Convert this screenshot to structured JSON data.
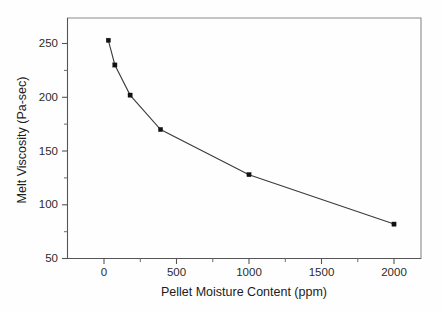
{
  "chart_data": {
    "type": "line",
    "title": "",
    "subtitle": "",
    "xlabel": "Pellet Moisture Content (ppm)",
    "ylabel": "Melt Viscosity (Pa-sec)",
    "xlim": [
      -200,
      2200
    ],
    "ylim": [
      50,
      268
    ],
    "grid": false,
    "legend": "none",
    "marker": "filled-square",
    "x_ticks": [
      0,
      500,
      1000,
      1500,
      2000
    ],
    "x_tick_labels": [
      "0",
      "500",
      "1000",
      "1500",
      "2000"
    ],
    "x_minor_ticks": [
      250,
      750,
      1250,
      1750
    ],
    "y_ticks": [
      50,
      100,
      150,
      200,
      250
    ],
    "y_tick_labels": [
      "50",
      "100",
      "150",
      "200",
      "250"
    ],
    "y_minor_ticks": [
      75,
      125,
      175,
      225
    ],
    "series": [
      {
        "name": "Melt Viscosity vs Pellet Moisture Content",
        "x": [
          30,
          75,
          180,
          390,
          1000,
          2000
        ],
        "values": [
          253,
          230,
          202,
          170,
          128,
          82
        ]
      }
    ],
    "points": [
      {
        "x": 30,
        "y": 253
      },
      {
        "x": 75,
        "y": 230
      },
      {
        "x": 180,
        "y": 202
      },
      {
        "x": 390,
        "y": 170
      },
      {
        "x": 1000,
        "y": 128
      },
      {
        "x": 2000,
        "y": 82
      }
    ],
    "colors": {
      "line": "#3b3b3b",
      "marker": "#121212",
      "axis": "#555555",
      "frame": "#8a8a8a",
      "background": "#fefefe",
      "text": "#1c1c1c"
    }
  }
}
